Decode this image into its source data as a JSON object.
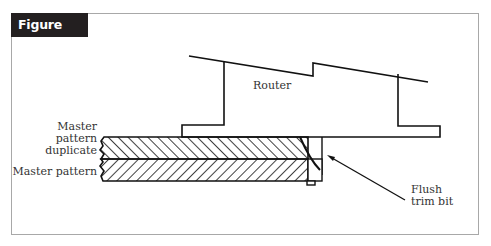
{
  "figure": {
    "label": "Figure 3.13"
  },
  "labels": {
    "router": "Router",
    "master_duplicate_line1": "Master",
    "master_duplicate_line2": "pattern",
    "master_duplicate_line3": "duplicate",
    "master_pattern": "Master pattern",
    "bit_line1": "Flush",
    "bit_line2": "trim bit"
  },
  "colors": {
    "label_bg": "#231f20",
    "stroke": "#111111",
    "frame": "#a8a8a8"
  }
}
